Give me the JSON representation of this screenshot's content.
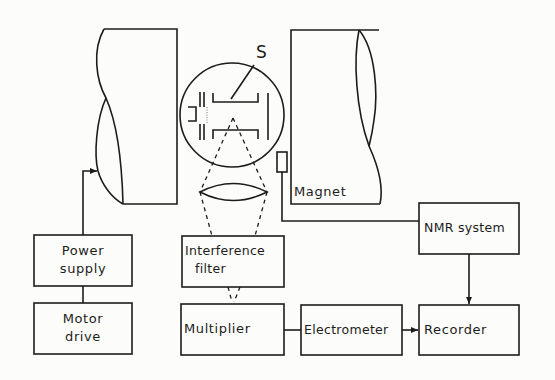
{
  "diagram": {
    "type": "block-diagram",
    "sample_label": "S",
    "magnet_label": "Magnet",
    "blocks": {
      "power_supply": {
        "line1": "Power",
        "line2": "supply"
      },
      "motor_drive": {
        "line1": "Motor",
        "line2": "drive"
      },
      "interference_filter": {
        "line1": "Interference",
        "line2": "filter"
      },
      "multiplier": {
        "label": "Multiplier"
      },
      "electrometer": {
        "label": "Electrometer"
      },
      "recorder": {
        "label": "Recorder"
      },
      "nmr_system": {
        "label": "NMR system"
      }
    },
    "connections": [
      {
        "from": "Motor drive",
        "to": "Power supply",
        "style": "solid"
      },
      {
        "from": "Power supply",
        "to": "Magnet (left pole)",
        "style": "solid-arrow"
      },
      {
        "from": "Sample cell",
        "to": "Lens",
        "style": "dashed"
      },
      {
        "from": "Lens",
        "to": "Interference filter",
        "style": "dashed"
      },
      {
        "from": "Interference filter",
        "to": "Multiplier",
        "style": "dashed-arrow"
      },
      {
        "from": "Multiplier",
        "to": "Electrometer",
        "style": "solid"
      },
      {
        "from": "Electrometer",
        "to": "Recorder",
        "style": "solid-arrow"
      },
      {
        "from": "NMR probe",
        "to": "NMR system",
        "style": "solid"
      },
      {
        "from": "NMR system",
        "to": "Recorder",
        "style": "solid-arrow"
      }
    ],
    "colors": {
      "ink": "#1c1c1c",
      "paper": "#fcfcfa"
    }
  }
}
